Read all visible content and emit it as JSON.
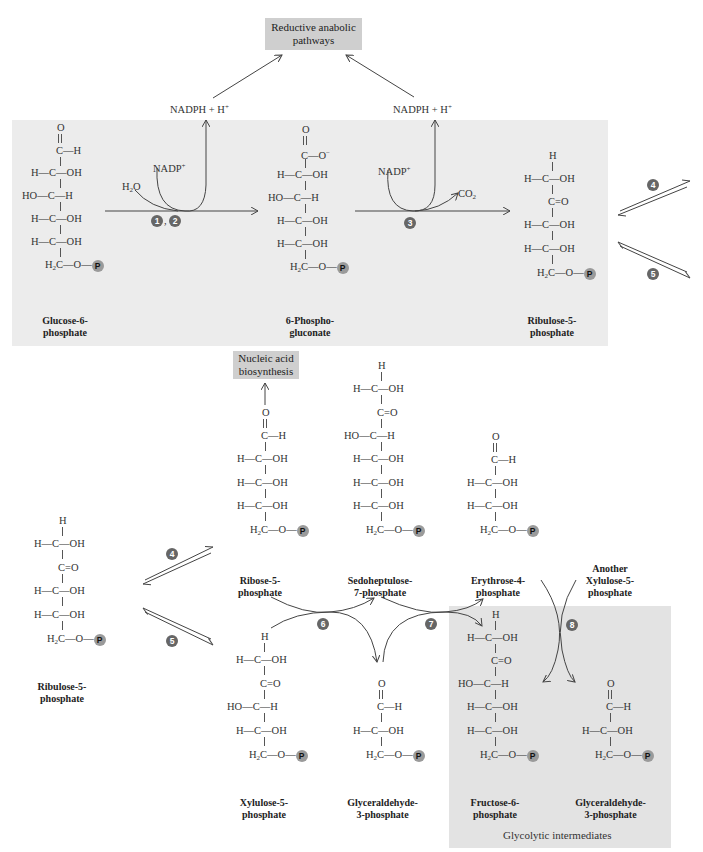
{
  "boxes": {
    "reductive": "Reductive anabolic pathways",
    "nucleic": "Nucleic acid biosynthesis",
    "glycolytic_caption": "Glycolytic intermediates"
  },
  "cofactors": {
    "nadph_1": "NADPH + H",
    "nadph_2": "NADPH + H",
    "nadp_1": "NADP",
    "nadp_2": "NADP",
    "h2o": "H",
    "co2": "CO"
  },
  "steps": {
    "s1": "1",
    "s2": "2",
    "s3": "3",
    "s4_top": "4",
    "s5_top": "5",
    "s4_bottom": "4",
    "s5_bottom": "5",
    "s6": "6",
    "s7": "7",
    "s8": "8"
  },
  "phosphate_badge": "P",
  "molecules": {
    "glucose6p": {
      "name_line1": "Glucose-6-",
      "name_line2": "phosphate"
    },
    "phosphogluconate": {
      "name_line1": "6-Phospho-",
      "name_line2": "gluconate"
    },
    "ribulose5p_top": {
      "name_line1": "Ribulose-5-",
      "name_line2": "phosphate"
    },
    "ribulose5p_bottom": {
      "name_line1": "Ribulose-5-",
      "name_line2": "phosphate"
    },
    "ribose5p": {
      "name_line1": "Ribose-5-",
      "name_line2": "phosphate"
    },
    "sedoheptulose7p": {
      "name_line1": "Sedoheptulose-",
      "name_line2": "7-phosphate"
    },
    "erythrose4p": {
      "name_line1": "Erythrose-4-",
      "name_line2": "phosphate"
    },
    "another_xylulose5p": {
      "name_line1": "Another",
      "name_line2": "Xylulose-5-",
      "name_line3": "phosphate"
    },
    "xylulose5p": {
      "name_line1": "Xylulose-5-",
      "name_line2": "phosphate"
    },
    "g3p_a": {
      "name_line1": "Glyceraldehyde-",
      "name_line2": "3-phosphate"
    },
    "fructose6p": {
      "name_line1": "Fructose-6-",
      "name_line2": "phosphate"
    },
    "g3p_b": {
      "name_line1": "Glyceraldehyde-",
      "name_line2": "3-phosphate"
    }
  },
  "structure_rows": {
    "aldehyde_top": "O",
    "cho": "C—H",
    "coo": "C—O",
    "h_c_oh": "H—C—OH",
    "ho_c_h": "HO—C—H",
    "c_eq_o": "C=O",
    "h_top": "H",
    "ch2o": "C—O—"
  },
  "colors": {
    "panel_bg": "#ececec",
    "box_bg": "#cfcfcf",
    "step_circle": "#666666",
    "phosphate_badge": "#9a9a9a",
    "line": "#444444"
  }
}
